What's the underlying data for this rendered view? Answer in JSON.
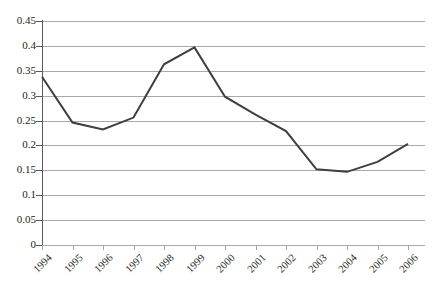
{
  "chart_data": {
    "type": "line",
    "title": "",
    "subtitle": "",
    "xlabel": "",
    "ylabel": "",
    "categories": [
      "1994",
      "1995",
      "1996",
      "1997",
      "1998",
      "1999",
      "2000",
      "2001",
      "2002",
      "2003",
      "2004",
      "2005",
      "2006"
    ],
    "values": [
      0.338,
      0.246,
      0.232,
      0.256,
      0.363,
      0.397,
      0.298,
      0.262,
      0.229,
      0.152,
      0.147,
      0.167,
      0.203
    ],
    "series": [
      {
        "name": "",
        "values": [
          0.338,
          0.246,
          0.232,
          0.256,
          0.363,
          0.397,
          0.298,
          0.262,
          0.229,
          0.152,
          0.147,
          0.167,
          0.203
        ]
      }
    ],
    "ylim": [
      0,
      0.45
    ],
    "y_ticks": [
      "0.45",
      "0.4",
      "0.35",
      "0.3",
      "0.25",
      "0.2",
      "0.15",
      "0.1",
      "0.05",
      "0"
    ],
    "y_tick_values": [
      0.45,
      0.4,
      0.35,
      0.3,
      0.25,
      0.2,
      0.15,
      0.1,
      0.05,
      0
    ],
    "x_tick_labels": [
      "1994",
      "1995",
      "1996",
      "1997",
      "1998",
      "1999",
      "2000",
      "2001",
      "2002",
      "2003",
      "2004",
      "2005",
      "2006"
    ],
    "grid": "horizontal",
    "legend": "none",
    "markers": "none",
    "line_color": "#3f3f42",
    "grid_color": "#a7a9ac",
    "axis_color": "#58595b",
    "background_color": "#ffffff",
    "annotations": []
  }
}
